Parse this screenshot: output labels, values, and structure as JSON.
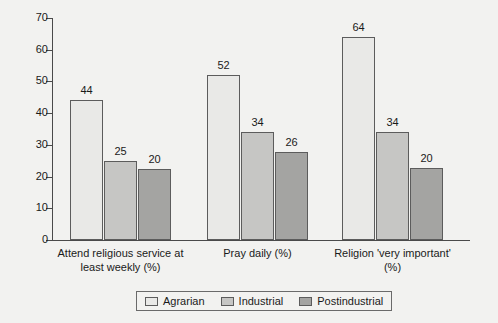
{
  "chart_data": {
    "type": "bar",
    "title": "",
    "subtitle": "",
    "xlabel": "",
    "ylabel": "",
    "ylim": [
      0,
      70
    ],
    "ytick_step": 10,
    "yticks": [
      "70",
      "60",
      "50",
      "40",
      "30",
      "20",
      "10",
      "0"
    ],
    "grid": false,
    "legend_position": "bottom",
    "categories": [
      "Attend religious service at least weekly (%)",
      "Pray daily (%)",
      "Religion 'very important' (%)"
    ],
    "category_lines": [
      [
        "Attend religious service at",
        "least weekly (%)"
      ],
      [
        "Pray daily (%)"
      ],
      [
        "Religion 'very important'",
        "(%)"
      ]
    ],
    "series": [
      {
        "name": "Agrarian",
        "color": "#e9e9e7",
        "values": [
          44,
          52,
          64
        ],
        "labels": [
          "44",
          "52",
          "64"
        ]
      },
      {
        "name": "Industrial",
        "color": "#c6c6c4",
        "values": [
          25,
          34,
          34
        ],
        "labels": [
          "25",
          "34",
          "34"
        ]
      },
      {
        "name": "Postindustrial",
        "color": "#a4a4a2",
        "values": [
          22.5,
          27.7,
          22.7
        ],
        "labels": [
          "20",
          "26",
          "20"
        ]
      }
    ]
  },
  "colors": {
    "background": "#f2f2f0",
    "axis": "#4a4a4a",
    "bar_border": "#5c5c5c",
    "text": "#1a1a1a",
    "legend_border": "#6a6a6a"
  }
}
